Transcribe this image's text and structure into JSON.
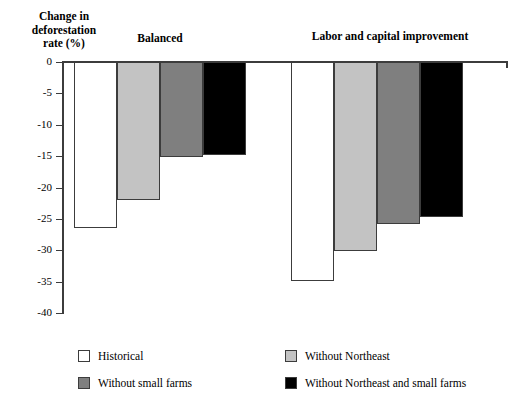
{
  "chart_data": {
    "type": "bar",
    "title": "",
    "ylabel": "Change in deforestation rate (%)",
    "xlabel": "",
    "ylim": [
      -40,
      0
    ],
    "yticks": [
      0,
      -5,
      -10,
      -15,
      -20,
      -25,
      -30,
      -35,
      -40
    ],
    "ytick_labels": [
      "0",
      "-5",
      "-10",
      "-15",
      "-20",
      "-25",
      "-30",
      "-35",
      "-40"
    ],
    "grid": false,
    "legend_position": "bottom",
    "categories": [
      "Balanced",
      "Labor and capital improvement"
    ],
    "series": [
      {
        "name": "Historical",
        "color": "#ffffff",
        "values": [
          -26.5,
          -34.9
        ]
      },
      {
        "name": "Without Northeast",
        "color": "#c3c3c3",
        "values": [
          -22.0,
          -30.1
        ]
      },
      {
        "name": "Without small farms",
        "color": "#7f7f7f",
        "values": [
          -15.2,
          -25.8
        ]
      },
      {
        "name": "Without Northeast and small farms",
        "color": "#000000",
        "values": [
          -14.8,
          -24.7
        ]
      }
    ]
  },
  "axis": {
    "y_title_lines": [
      "Change in",
      "deforestation",
      "rate (%)"
    ]
  }
}
